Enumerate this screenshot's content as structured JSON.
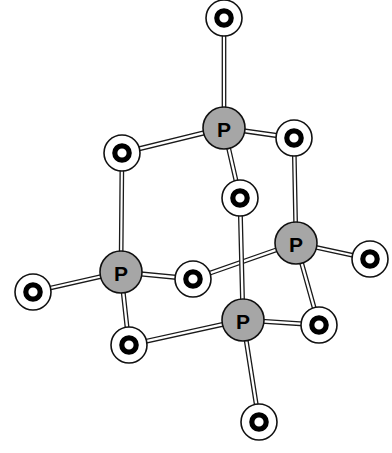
{
  "figure": {
    "formula": "P4O10",
    "canvas": {
      "width": 392,
      "height": 453,
      "background": "#ffffff"
    },
    "style": {
      "phosphorus_fill": "#a6a6a6",
      "phosphorus_stroke": "#111111",
      "oxygen_fill": "#ffffff",
      "oxygen_stroke": "#111111",
      "oxygen_ring": "#000000",
      "bond_fill": "#ffffff",
      "bond_stroke": "#1a1a1a",
      "label_color": "#000000"
    }
  },
  "atoms": [
    {
      "id": "P1",
      "element": "P",
      "label": "P",
      "x": 224,
      "y": 128,
      "r": 21,
      "role": "phosphorus-apex-top"
    },
    {
      "id": "P2",
      "element": "P",
      "label": "P",
      "x": 121,
      "y": 272,
      "r": 21,
      "role": "phosphorus-apex-left"
    },
    {
      "id": "P3",
      "element": "P",
      "label": "P",
      "x": 296,
      "y": 243,
      "r": 21,
      "role": "phosphorus-apex-right"
    },
    {
      "id": "P4",
      "element": "P",
      "label": "P",
      "x": 243,
      "y": 320,
      "r": 21,
      "role": "phosphorus-apex-front"
    },
    {
      "id": "O1",
      "element": "O",
      "label": "O",
      "x": 224,
      "y": 18,
      "r": 18,
      "role": "oxygen-terminal-top"
    },
    {
      "id": "O2",
      "element": "O",
      "label": "O",
      "x": 33,
      "y": 292,
      "r": 18,
      "role": "oxygen-terminal-left"
    },
    {
      "id": "O3",
      "element": "O",
      "label": "O",
      "x": 370,
      "y": 259,
      "r": 18,
      "role": "oxygen-terminal-right"
    },
    {
      "id": "O4",
      "element": "O",
      "label": "O",
      "x": 259,
      "y": 422,
      "r": 18,
      "role": "oxygen-terminal-bottom"
    },
    {
      "id": "O5",
      "element": "O",
      "label": "O",
      "x": 122,
      "y": 153,
      "r": 18,
      "role": "oxygen-bridge-upper-left"
    },
    {
      "id": "O6",
      "element": "O",
      "label": "O",
      "x": 294,
      "y": 138,
      "r": 18,
      "role": "oxygen-bridge-upper-right"
    },
    {
      "id": "O7",
      "element": "O",
      "label": "O",
      "x": 240,
      "y": 198,
      "r": 18,
      "role": "oxygen-bridge-center"
    },
    {
      "id": "O8",
      "element": "O",
      "label": "O",
      "x": 193,
      "y": 279,
      "r": 18,
      "role": "oxygen-bridge-middle"
    },
    {
      "id": "O9",
      "element": "O",
      "label": "O",
      "x": 129,
      "y": 345,
      "r": 18,
      "role": "oxygen-bridge-lower-left"
    },
    {
      "id": "O10",
      "element": "O",
      "label": "O",
      "x": 319,
      "y": 325,
      "r": 18,
      "role": "oxygen-bridge-lower-right"
    }
  ],
  "bonds": [
    {
      "from": "P1",
      "to": "O1",
      "w": 3.4,
      "name": "bond-p1-o1-terminal"
    },
    {
      "from": "P1",
      "to": "O5",
      "w": 3.8,
      "name": "bond-p1-o5-bridge"
    },
    {
      "from": "P1",
      "to": "O6",
      "w": 3.8,
      "name": "bond-p1-o6-bridge"
    },
    {
      "from": "P1",
      "to": "O7",
      "w": 3.6,
      "name": "bond-p1-o7-bridge"
    },
    {
      "from": "P2",
      "to": "O2",
      "w": 3.4,
      "name": "bond-p2-o2-terminal"
    },
    {
      "from": "P2",
      "to": "O5",
      "w": 3.4,
      "name": "bond-p2-o5-bridge"
    },
    {
      "from": "P2",
      "to": "O8",
      "w": 3.8,
      "name": "bond-p2-o8-bridge"
    },
    {
      "from": "P2",
      "to": "O9",
      "w": 3.6,
      "name": "bond-p2-o9-bridge"
    },
    {
      "from": "P3",
      "to": "O3",
      "w": 3.4,
      "name": "bond-p3-o3-terminal"
    },
    {
      "from": "P3",
      "to": "O6",
      "w": 3.4,
      "name": "bond-p3-o6-bridge"
    },
    {
      "from": "P3",
      "to": "O8",
      "w": 3.6,
      "name": "bond-p3-o8-bridge"
    },
    {
      "from": "P3",
      "to": "O10",
      "w": 3.6,
      "name": "bond-p3-o10-bridge"
    },
    {
      "from": "P4",
      "to": "O4",
      "w": 3.6,
      "name": "bond-p4-o4-terminal"
    },
    {
      "from": "P4",
      "to": "O7",
      "w": 3.6,
      "name": "bond-p4-o7-bridge"
    },
    {
      "from": "P4",
      "to": "O9",
      "w": 3.6,
      "name": "bond-p4-o9-bridge"
    },
    {
      "from": "P4",
      "to": "O10",
      "w": 3.6,
      "name": "bond-p4-o10-bridge"
    }
  ],
  "draw_order": {
    "bonds_behind": [
      "bond-p1-o1-terminal",
      "bond-p1-o5-bridge",
      "bond-p1-o6-bridge",
      "bond-p1-o7-bridge",
      "bond-p2-o2-terminal",
      "bond-p2-o5-bridge",
      "bond-p2-o8-bridge",
      "bond-p2-o9-bridge",
      "bond-p3-o3-terminal",
      "bond-p3-o6-bridge",
      "bond-p3-o8-bridge",
      "bond-p3-o10-bridge",
      "bond-p4-o4-terminal",
      "bond-p4-o7-bridge",
      "bond-p4-o9-bridge",
      "bond-p4-o10-bridge"
    ],
    "atoms_front": [
      "O1",
      "O5",
      "O6",
      "O7",
      "O2",
      "O8",
      "O9",
      "O3",
      "O10",
      "O4",
      "P1",
      "P2",
      "P3",
      "P4"
    ]
  }
}
